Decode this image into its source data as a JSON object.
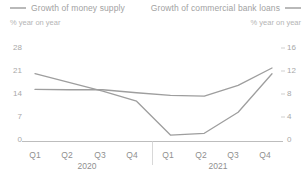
{
  "legend": {
    "series_left": {
      "label": "Growth of money supply",
      "unit": "% year on year",
      "swatch": "line-swatch",
      "color": "#b9b9b9"
    },
    "series_right": {
      "label": "Growth of commercial bank loans",
      "unit": "% year on year",
      "swatch": "line-swatch",
      "color": "#b9b9b9"
    }
  },
  "chart_data": {
    "type": "line",
    "title": "",
    "subtitle": "",
    "xlabel": "",
    "grid": false,
    "legend_position": "top",
    "categories": [
      "Q1",
      "Q2",
      "Q3",
      "Q4",
      "Q1",
      "Q2",
      "Q3",
      "Q4"
    ],
    "group_labels": [
      "2020",
      "2021"
    ],
    "axes": {
      "left": {
        "label": "% year on year",
        "ticks": [
          0,
          7,
          14,
          21,
          28
        ],
        "ylim": [
          0,
          28
        ]
      },
      "right": {
        "label": "% year on year",
        "ticks": [
          0,
          4,
          8,
          12,
          16
        ],
        "ylim": [
          0,
          16
        ]
      }
    },
    "series": [
      {
        "name": "Growth of money supply",
        "axis": "left",
        "color": "#9e9e9e",
        "values": [
          15.6,
          15.5,
          15.5,
          14.6,
          13.8,
          13.6,
          16.8,
          22.0
        ]
      },
      {
        "name": "Growth of commercial bank loans",
        "axis": "right",
        "color": "#9e9e9e",
        "values": [
          11.6,
          10.1,
          8.6,
          6.9,
          1.1,
          1.4,
          5.0,
          11.6
        ]
      }
    ]
  },
  "ticks": {
    "left": [
      "28",
      "21",
      "14",
      "7",
      "0"
    ],
    "right": [
      "16",
      "12",
      "8",
      "4",
      "0"
    ],
    "x": [
      "Q1",
      "Q2",
      "Q3",
      "Q4",
      "Q1",
      "Q2",
      "Q3",
      "Q4"
    ],
    "years": [
      "2020",
      "2021"
    ]
  }
}
